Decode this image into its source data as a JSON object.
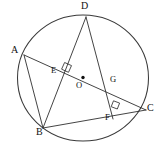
{
  "figure": {
    "type": "circle-geometry-diagram",
    "width": 160,
    "height": 150,
    "background_color": "#ffffff",
    "stroke_color": "#2f2f2f",
    "label_color": "#111111",
    "circle": {
      "name": "circumscribed-circle",
      "center_label": "O",
      "center_x": 83,
      "center_y": 78,
      "radius": 64
    },
    "vertices": [
      {
        "id": "A",
        "label": "A",
        "x": 24,
        "y": 55,
        "label_x": 11,
        "label_y": 46,
        "on_circle": true
      },
      {
        "id": "B",
        "label": "B",
        "x": 43,
        "y": 128,
        "label_x": 37,
        "label_y": 128,
        "on_circle": true
      },
      {
        "id": "C",
        "label": "C",
        "x": 145,
        "y": 110,
        "label_x": 147,
        "label_y": 103,
        "on_circle": true
      },
      {
        "id": "D",
        "label": "D",
        "x": 86,
        "y": 17,
        "label_x": 82,
        "label_y": 2,
        "on_circle": true
      }
    ],
    "interior_points": [
      {
        "id": "E",
        "label": "E",
        "x": 64,
        "y": 70,
        "label_x": 52,
        "label_y": 69,
        "description": "intersection of chord AC and chord BD"
      },
      {
        "id": "O",
        "label": "O",
        "x": 83,
        "y": 78,
        "label_x": 76,
        "label_y": 82,
        "description": "center of circle"
      },
      {
        "id": "G",
        "label": "G",
        "x": 112,
        "y": 87,
        "label_x": 110,
        "label_y": 77,
        "description": "intersection of chord AC and segment DF"
      },
      {
        "id": "F",
        "label": "F",
        "x": 110,
        "y": 113,
        "label_x": 106,
        "label_y": 114,
        "description": "intersection of chord BC and segment DF"
      }
    ],
    "segments": [
      {
        "name": "chord-AC",
        "from": "A",
        "to": "C",
        "x1": 24,
        "y1": 55,
        "x2": 145,
        "y2": 110
      },
      {
        "name": "chord-BD",
        "from": "B",
        "to": "D",
        "x1": 43,
        "y1": 128,
        "x2": 86,
        "y2": 17
      },
      {
        "name": "chord-BC",
        "from": "B",
        "to": "C",
        "x1": 43,
        "y1": 128,
        "x2": 145,
        "y2": 110
      },
      {
        "name": "chord-AB",
        "from": "A",
        "to": "B",
        "x1": 24,
        "y1": 55,
        "x2": 43,
        "y2": 128
      },
      {
        "name": "segment-DF",
        "from": "D",
        "to": "F",
        "x1": 86,
        "y1": 17,
        "x2": 112,
        "y2": 117
      }
    ],
    "right_angles": [
      {
        "name": "right-angle-at-E",
        "at": "E",
        "x": 64,
        "y": 70,
        "note": "AC perpendicular to BD"
      },
      {
        "name": "right-angle-at-F",
        "at": "F",
        "x": 110,
        "y": 113,
        "note": "DF perpendicular to BC"
      }
    ]
  }
}
